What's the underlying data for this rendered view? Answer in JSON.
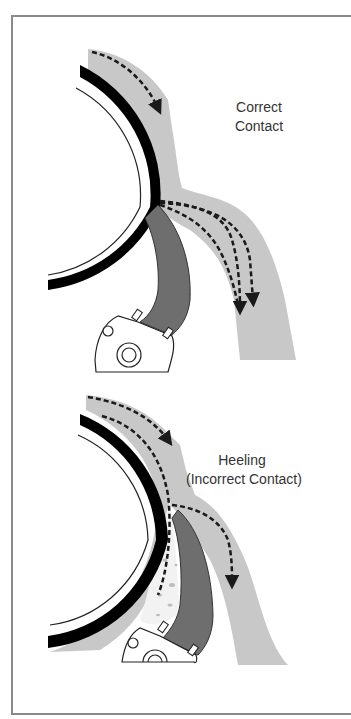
{
  "figure": {
    "panels": [
      {
        "id": "correct-contact",
        "title_line1": "Correct",
        "title_line2": "Contact"
      },
      {
        "id": "heeling",
        "title_line1": "Heeling",
        "title_line2": "(Incorrect Contact)"
      }
    ],
    "colors": {
      "frame": "#8a8a8a",
      "fluid_band": "#c8c8c8",
      "tire_band": "#000000",
      "shoe": "#6e6e6e",
      "debris_fill": "#f2f2f2",
      "text": "#333333",
      "arrow": "#1a1a1a"
    }
  }
}
